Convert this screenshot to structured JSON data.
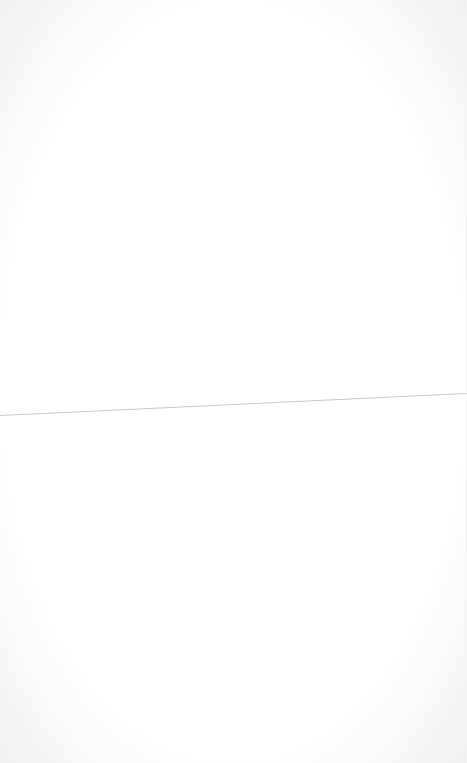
{
  "page": {
    "background": "#ffffff",
    "rule_color": "#c8c8c8"
  }
}
